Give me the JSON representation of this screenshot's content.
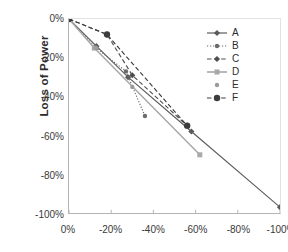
{
  "chart_data": {
    "type": "line",
    "title": "",
    "xlabel": "",
    "ylabel": "Loss of Power",
    "xlim": [
      0,
      -100
    ],
    "ylim": [
      0,
      -100
    ],
    "grid": false,
    "legend_position": "top-right",
    "x_tick_labels": [
      "0%",
      "-20%",
      "-40%",
      "-60%",
      "-80%",
      "-100%"
    ],
    "y_tick_labels": [
      "0%",
      "-20%",
      "-40%",
      "-60%",
      "-80%",
      "-100%"
    ],
    "x_ticks": [
      0,
      -20,
      -40,
      -60,
      -80,
      -100
    ],
    "y_ticks": [
      0,
      -20,
      -40,
      -60,
      -80,
      -100
    ],
    "series": [
      {
        "name": "A",
        "style": "solid",
        "color": "#5a5a5a",
        "marker": "diamond",
        "points": [
          [
            0,
            0
          ],
          [
            -13,
            -14
          ],
          [
            -28,
            -30
          ],
          [
            -58,
            -58
          ],
          [
            -100,
            -97
          ]
        ]
      },
      {
        "name": "B",
        "style": "dotted",
        "color": "#6b6b6b",
        "marker": "circle",
        "points": [
          [
            0,
            0
          ],
          [
            -13,
            -15
          ],
          [
            -27,
            -27
          ],
          [
            -36,
            -50
          ]
        ]
      },
      {
        "name": "C",
        "style": "dashed",
        "color": "#4f4f4f",
        "marker": "diamond",
        "points": [
          [
            0,
            0
          ],
          [
            -18,
            -8
          ],
          [
            -30,
            -29
          ],
          [
            -56,
            -55
          ]
        ]
      },
      {
        "name": "D",
        "style": "solid",
        "color": "#a8a8a8",
        "marker": "square",
        "points": [
          [
            0,
            0
          ],
          [
            -12,
            -15
          ],
          [
            -62,
            -70
          ]
        ]
      },
      {
        "name": "E",
        "style": "none",
        "color": "#9a9a9a",
        "marker": "circle",
        "points": [
          [
            0,
            0
          ],
          [
            -13,
            -15
          ],
          [
            -30,
            -35
          ]
        ]
      },
      {
        "name": "F",
        "style": "dashed",
        "color": "#3c3c3c",
        "marker": "circle-large",
        "points": [
          [
            0,
            0
          ],
          [
            -18,
            -8
          ],
          [
            -56,
            -55
          ]
        ]
      }
    ]
  },
  "legend": {
    "entries": [
      {
        "label": "A"
      },
      {
        "label": "B"
      },
      {
        "label": "C"
      },
      {
        "label": "D"
      },
      {
        "label": "E"
      },
      {
        "label": "F"
      }
    ]
  },
  "axes": {
    "y_title": "Loss of Power"
  }
}
